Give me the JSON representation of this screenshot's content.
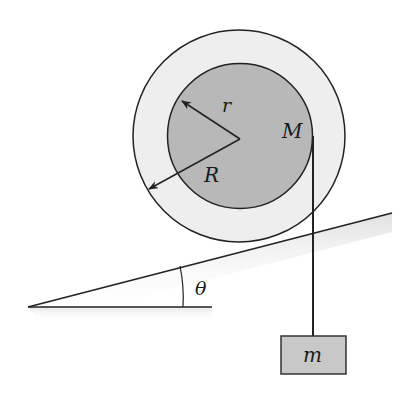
{
  "diagram": {
    "labels": {
      "inner_radius": "r",
      "outer_radius": "R",
      "mass_wheel": "M",
      "angle": "θ",
      "hanging_mass": "m"
    },
    "colors": {
      "outer_disk": "#eeeeee",
      "inner_disk": "#b8b8b8",
      "block": "#c8c8c8",
      "stroke": "#222222",
      "incline_shade": "#e6e6e6"
    }
  }
}
